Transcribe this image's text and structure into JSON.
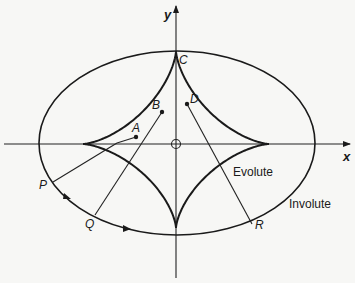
{
  "figure": {
    "axes": {
      "x_label": "x",
      "y_label": "y"
    },
    "curves": {
      "evolute_label": "Evolute",
      "involute_label": "Involute"
    },
    "points": {
      "A": "A",
      "B": "B",
      "C": "C",
      "D": "D",
      "P": "P",
      "Q": "Q",
      "R": "R"
    },
    "colors": {
      "ink": "#1a1a1a",
      "paper": "#f7f7f5"
    }
  }
}
